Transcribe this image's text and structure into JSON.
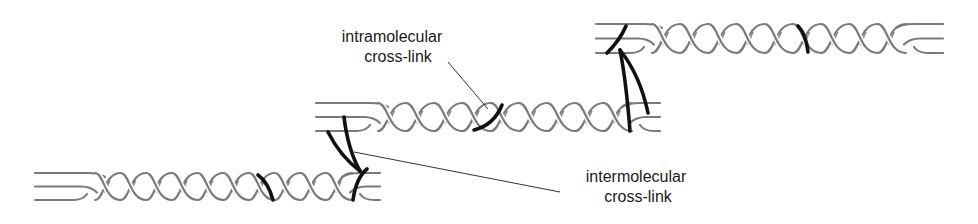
{
  "figure": {
    "type": "collagen triple-helix cross-link diagram",
    "colors": {
      "strand": "#7a7a7a",
      "cross_link": "#111111",
      "leader": "#333333",
      "text": "#1a1a1a"
    },
    "molecules": [
      {
        "name": "lower-molecule",
        "strands": 3,
        "cross_links": [
          "intramolecular",
          "intermolecular-end"
        ]
      },
      {
        "name": "middle-molecule",
        "strands": 3,
        "cross_links": [
          "intramolecular",
          "intermolecular-start",
          "intermolecular-end"
        ]
      },
      {
        "name": "upper-molecule",
        "strands": 3,
        "cross_links": [
          "intramolecular",
          "intermolecular-start"
        ]
      }
    ]
  },
  "labels": {
    "intramolecular": {
      "line1": "intramolecular",
      "line2": "cross-link"
    },
    "intermolecular": {
      "line1": "intermolecular",
      "line2": "cross-link"
    }
  }
}
